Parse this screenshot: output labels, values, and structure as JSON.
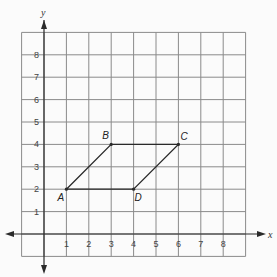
{
  "diagram": {
    "type": "coordinate-grid",
    "x_axis_label": "x",
    "y_axis_label": "y",
    "x_ticks": [
      "1",
      "2",
      "3",
      "4",
      "5",
      "6",
      "7",
      "8"
    ],
    "y_ticks": [
      "1",
      "2",
      "3",
      "4",
      "5",
      "6",
      "7",
      "8"
    ],
    "grid_range": {
      "x": [
        -1,
        9
      ],
      "y": [
        -1,
        9
      ]
    },
    "points": [
      {
        "label": "A",
        "x": 1,
        "y": 2
      },
      {
        "label": "B",
        "x": 3,
        "y": 4
      },
      {
        "label": "C",
        "x": 6,
        "y": 4
      },
      {
        "label": "D",
        "x": 4,
        "y": 2
      }
    ],
    "polygon": [
      "A",
      "B",
      "C",
      "D"
    ],
    "colors": {
      "grid": "#8a8a8a",
      "axis": "#2a2a2a",
      "shape": "#2a2a2a",
      "background": "#fbfbfb"
    }
  }
}
